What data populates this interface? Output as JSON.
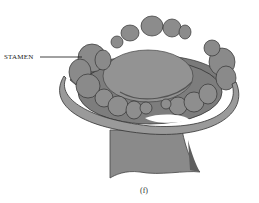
{
  "figure": {
    "labels": [
      {
        "text": "STAMEN"
      }
    ],
    "caption": "(f)",
    "colors": {
      "fill": "#8a8a8a",
      "shade": "#5e5e5e",
      "light": "#a9a9a9",
      "stroke": "#333333"
    }
  }
}
